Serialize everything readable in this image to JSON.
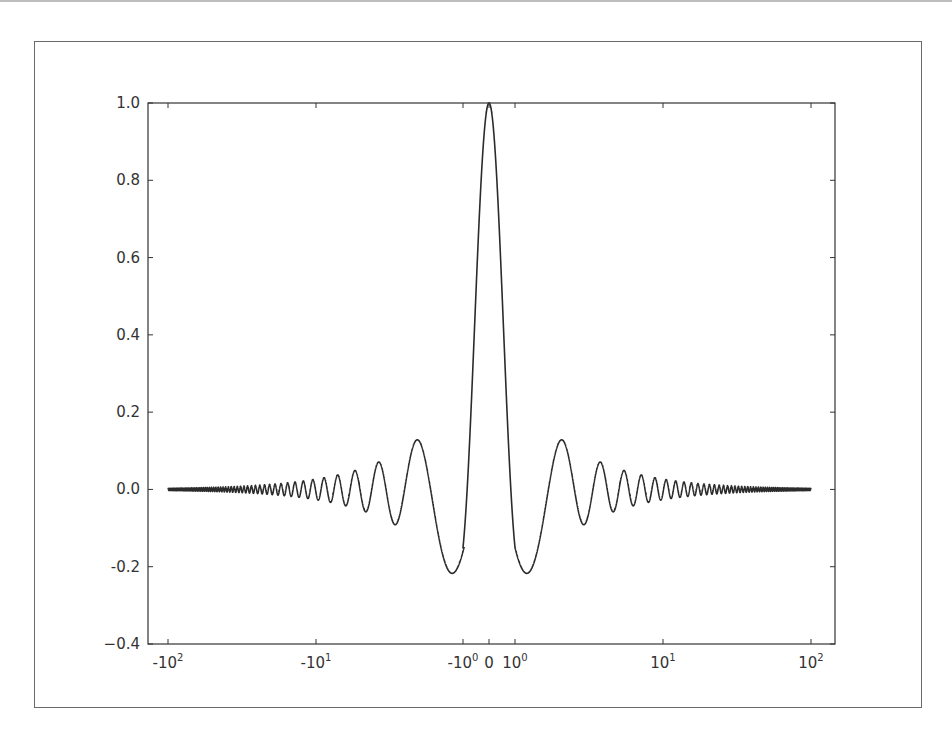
{
  "chart_data": {
    "type": "line",
    "title": "",
    "xlabel": "",
    "ylabel": "",
    "xscale": "symlog",
    "xlim": [
      -100,
      100
    ],
    "ylim": [
      -0.4,
      1.0
    ],
    "grid": false,
    "legend": null,
    "x_ticks": [
      {
        "value": -100,
        "label": "-10",
        "exp": "2"
      },
      {
        "value": -10,
        "label": "-10",
        "exp": "1"
      },
      {
        "value": -1,
        "label": "-10",
        "exp": "0"
      },
      {
        "value": 0,
        "label": "0",
        "exp": ""
      },
      {
        "value": 1,
        "label": "10",
        "exp": "0"
      },
      {
        "value": 10,
        "label": "10",
        "exp": "1"
      },
      {
        "value": 100,
        "label": "10",
        "exp": "2"
      }
    ],
    "y_ticks": [
      {
        "value": 1.0,
        "label": "1.0"
      },
      {
        "value": 0.8,
        "label": "0.8"
      },
      {
        "value": 0.6,
        "label": "0.6"
      },
      {
        "value": 0.4,
        "label": "0.4"
      },
      {
        "value": 0.2,
        "label": "0.2"
      },
      {
        "value": 0.0,
        "label": "0.0"
      },
      {
        "value": -0.2,
        "label": "-0.2"
      },
      {
        "value": -0.4,
        "label": "−0.4"
      }
    ],
    "series": [
      {
        "name": "sinc",
        "function": "sin(pi*a*x)/(pi*a*x)",
        "a": 1.19,
        "x_range": [
          -100,
          100
        ],
        "color": "#2b2b2b",
        "key_points": [
          {
            "x": 0,
            "y": 1.0
          },
          {
            "x": -1.2,
            "y": -0.217
          },
          {
            "x": 1.2,
            "y": -0.217
          },
          {
            "x": -2.07,
            "y": 0.128
          },
          {
            "x": 2.07,
            "y": 0.128
          },
          {
            "x": -2.9,
            "y": -0.091
          },
          {
            "x": 2.9,
            "y": -0.091
          },
          {
            "x": -3.8,
            "y": 0.071
          },
          {
            "x": 3.8,
            "y": 0.071
          }
        ]
      }
    ]
  },
  "layout": {
    "plot_left_px": 148,
    "plot_right_px": 835,
    "plot_top_px": 103,
    "plot_bottom_px": 644,
    "neg_one_px": 464,
    "zero_px": 489,
    "pos_one_px": 515,
    "decade_px": 148
  }
}
